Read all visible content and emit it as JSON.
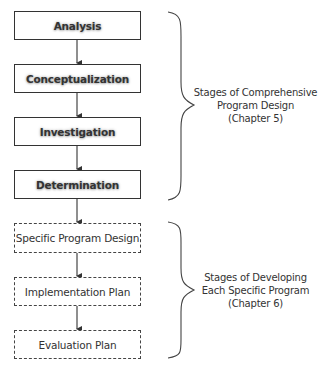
{
  "diagram": {
    "stages": [
      {
        "label": "Analysis",
        "style": "solid",
        "group": "comprehensive"
      },
      {
        "label": "Conceptualization",
        "style": "solid",
        "group": "comprehensive"
      },
      {
        "label": "Investigation",
        "style": "solid",
        "group": "comprehensive"
      },
      {
        "label": "Determination",
        "style": "solid",
        "group": "comprehensive"
      },
      {
        "label": "Specific Program Design",
        "style": "dashed",
        "group": "specific"
      },
      {
        "label": "Implementation Plan",
        "style": "dashed",
        "group": "specific"
      },
      {
        "label": "Evaluation Plan",
        "style": "dashed",
        "group": "specific"
      }
    ],
    "groups": [
      {
        "id": "comprehensive",
        "lines": [
          "Stages of Comprehensive",
          "Program Design",
          "(Chapter 5)"
        ]
      },
      {
        "id": "specific",
        "lines": [
          "Stages of Developing",
          "Each Specific Program",
          "(Chapter 6)"
        ]
      }
    ],
    "colors": {
      "line": "#333333",
      "text": "#333333",
      "background": "#ffffff"
    }
  }
}
